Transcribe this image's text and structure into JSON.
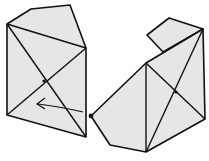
{
  "diagram": {
    "title": "",
    "background": "#ffffff",
    "fill_color": "#e6e6e6",
    "stroke_color": "#111111",
    "left_shape": {
      "outline": "7,24 31,9 70,5 86,48 86,137 7,115",
      "edges": [
        {
          "x1": 7,
          "y1": 24,
          "x2": 86,
          "y2": 48
        },
        {
          "x1": 7,
          "y1": 24,
          "x2": 86,
          "y2": 137
        },
        {
          "x1": 7,
          "y1": 115,
          "x2": 86,
          "y2": 48
        }
      ],
      "center_dot": {
        "cx": 44,
        "cy": 81
      }
    },
    "arrow": {
      "path": "M83,112 C70,109 55,106 38,104",
      "head": "M45,98 L37,104 L45,109"
    },
    "right_shape": {
      "small_quad": "147,35 169,18 203,29 163,52",
      "outline": "91,116 146,63 203,29 205,119 146,152 110,145",
      "edges": [
        {
          "x1": 146,
          "y1": 63,
          "x2": 146,
          "y2": 152
        },
        {
          "x1": 146,
          "y1": 63,
          "x2": 205,
          "y2": 119
        },
        {
          "x1": 146,
          "y1": 152,
          "x2": 203,
          "y2": 29
        }
      ],
      "vertex_dot": {
        "cx": 91,
        "cy": 116
      },
      "center_dot": {
        "cx": 176,
        "cy": 92
      }
    }
  }
}
